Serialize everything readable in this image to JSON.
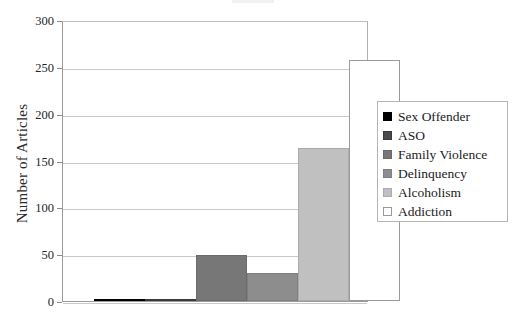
{
  "chart_data": {
    "type": "bar",
    "title": "",
    "subtitle": "",
    "xlabel": "",
    "ylabel": "Number of Articles",
    "categories": [
      "Sex Offender",
      "ASO",
      "Family Violence",
      "Delinquency",
      "Alcoholism",
      "Addiction"
    ],
    "values": [
      2,
      1,
      49,
      30,
      163,
      257
    ],
    "ylim": [
      0,
      300
    ],
    "yticks": [
      0,
      50,
      100,
      150,
      200,
      250,
      300
    ],
    "ytick_labels": [
      "0",
      "50",
      "100",
      "150",
      "200",
      "250",
      "300"
    ],
    "xtick_labels": [
      "",
      "",
      "",
      "",
      "",
      ""
    ],
    "grid": true,
    "grid_axis": "y",
    "legend_position": "right-outside",
    "legend": [
      {
        "label": "Sex Offender",
        "color": "#000000",
        "border": "#000000"
      },
      {
        "label": "ASO",
        "color": "#4a4a4a",
        "border": "#3a3a3a"
      },
      {
        "label": "Family Violence",
        "color": "#777777",
        "border": "#6a6a6a"
      },
      {
        "label": "Delinquency",
        "color": "#8d8d8d",
        "border": "#7f7f7f"
      },
      {
        "label": "Alcoholism",
        "color": "#c0c0c0",
        "border": "#ababab"
      },
      {
        "label": "Addiction",
        "color": "#ffffff",
        "border": "#9a9a9a"
      }
    ],
    "series": [
      {
        "name": "Number of Articles",
        "values": [
          2,
          1,
          49,
          30,
          163,
          257
        ]
      }
    ]
  }
}
